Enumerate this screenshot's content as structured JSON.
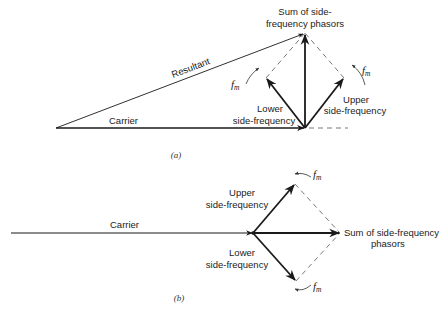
{
  "diagram_a": {
    "caption": "(a)",
    "labels": {
      "sum_line1": "Sum of side-",
      "sum_line2": "frequency phasors",
      "resultant": "Resultant",
      "carrier": "Carrier",
      "lower_line1": "Lower",
      "lower_line2": "side-frequency",
      "upper_line1": "Upper",
      "upper_line2": "side-frequency",
      "fm_main": "f",
      "fm_sub": "m"
    }
  },
  "diagram_b": {
    "caption": "(b)",
    "labels": {
      "carrier": "Carrier",
      "upper_line1": "Upper",
      "upper_line2": "side-frequency",
      "lower_line1": "Lower",
      "lower_line2": "side-frequency",
      "sum_line1": "Sum of side-frequency",
      "sum_line2": "phasors",
      "fm_main": "f",
      "fm_sub": "m"
    }
  },
  "colors": {
    "stroke": "#1a1a1a",
    "dashed": "#555555"
  }
}
